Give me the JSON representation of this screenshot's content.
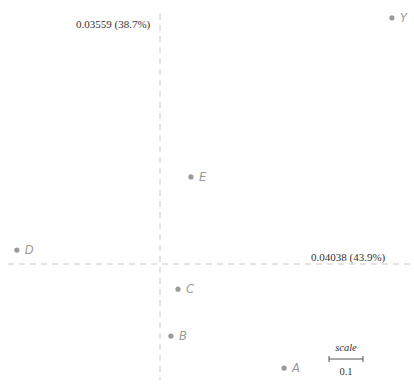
{
  "chart_data": {
    "type": "scatter",
    "title": "",
    "x_axis_label": "0.04038 (43.9%)",
    "y_axis_label": "0.03559 (38.7%)",
    "grid": false,
    "origin_px": [
      160,
      264
    ],
    "px_per_unit": 340,
    "points": [
      {
        "label": "Y",
        "x": 0.682,
        "y": 0.724
      },
      {
        "label": "E",
        "x": 0.091,
        "y": 0.256
      },
      {
        "label": "D",
        "x": -0.421,
        "y": 0.041
      },
      {
        "label": "C",
        "x": 0.053,
        "y": -0.074
      },
      {
        "label": "B",
        "x": 0.032,
        "y": -0.212
      },
      {
        "label": "A",
        "x": 0.365,
        "y": -0.306
      }
    ],
    "scale_bar": {
      "label": "scale",
      "value": "0.1",
      "length_units": 0.1
    },
    "colors": {
      "point": "#9a9a9a",
      "axis": "#c8c8c8",
      "text": "#333333"
    }
  }
}
